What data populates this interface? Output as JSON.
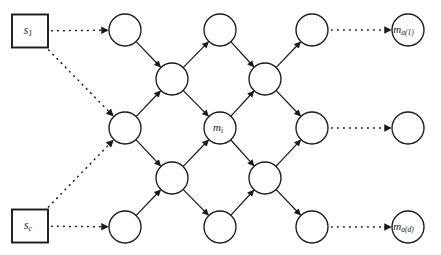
{
  "figure": {
    "background_color": "#ffffff",
    "stroke_color": "#1a1a1a",
    "width": 441,
    "height": 255
  },
  "sources": [
    {
      "id": "s1",
      "label": "s",
      "sub": "1",
      "x": 30,
      "y": 31,
      "w": 36,
      "h": 33
    },
    {
      "id": "sc",
      "label": "s",
      "sub": "c",
      "x": 30,
      "y": 226,
      "w": 36,
      "h": 33
    }
  ],
  "nodes": [
    {
      "id": "n-c1-r1",
      "x": 125,
      "y": 30,
      "r": 16,
      "label": "",
      "sub": ""
    },
    {
      "id": "n-c2-r1",
      "x": 220,
      "y": 30,
      "r": 16,
      "label": "",
      "sub": ""
    },
    {
      "id": "n-c3-r1",
      "x": 312,
      "y": 30,
      "r": 16,
      "label": "",
      "sub": ""
    },
    {
      "id": "n-out-top",
      "x": 408,
      "y": 30,
      "r": 16,
      "label": "m",
      "sub": "a(1)"
    },
    {
      "id": "n-c1-r2",
      "x": 172,
      "y": 79,
      "r": 16,
      "label": "",
      "sub": ""
    },
    {
      "id": "n-c2-r2",
      "x": 265,
      "y": 79,
      "r": 16,
      "label": "",
      "sub": ""
    },
    {
      "id": "n-c0-r3",
      "x": 125,
      "y": 128,
      "r": 16,
      "label": "",
      "sub": ""
    },
    {
      "id": "n-c2-r3",
      "x": 220,
      "y": 128,
      "r": 16,
      "label": "m",
      "sub": "i"
    },
    {
      "id": "n-c3-r3",
      "x": 312,
      "y": 128,
      "r": 16,
      "label": "",
      "sub": ""
    },
    {
      "id": "n-out-mid",
      "x": 408,
      "y": 128,
      "r": 16,
      "label": "",
      "sub": ""
    },
    {
      "id": "n-c1-r4",
      "x": 172,
      "y": 178,
      "r": 16,
      "label": "",
      "sub": ""
    },
    {
      "id": "n-c2-r4",
      "x": 265,
      "y": 178,
      "r": 16,
      "label": "",
      "sub": ""
    },
    {
      "id": "n-c1-r5",
      "x": 125,
      "y": 227,
      "r": 16,
      "label": "",
      "sub": ""
    },
    {
      "id": "n-c2-r5",
      "x": 220,
      "y": 227,
      "r": 16,
      "label": "",
      "sub": ""
    },
    {
      "id": "n-c3-r5",
      "x": 312,
      "y": 227,
      "r": 16,
      "label": "",
      "sub": ""
    },
    {
      "id": "n-out-bot",
      "x": 408,
      "y": 227,
      "r": 16,
      "label": "m",
      "sub": "a(d)"
    }
  ],
  "solid_edges": [
    {
      "from": "n-c1-r1",
      "to": "n-c1-r2"
    },
    {
      "from": "n-c1-r2",
      "to": "n-c2-r1"
    },
    {
      "from": "n-c2-r1",
      "to": "n-c2-r2"
    },
    {
      "from": "n-c2-r2",
      "to": "n-c3-r1"
    },
    {
      "from": "n-c0-r3",
      "to": "n-c1-r2"
    },
    {
      "from": "n-c1-r2",
      "to": "n-c2-r3"
    },
    {
      "from": "n-c2-r3",
      "to": "n-c2-r2"
    },
    {
      "from": "n-c2-r2",
      "to": "n-c3-r3"
    },
    {
      "from": "n-c0-r3",
      "to": "n-c1-r4"
    },
    {
      "from": "n-c1-r4",
      "to": "n-c2-r3"
    },
    {
      "from": "n-c2-r3",
      "to": "n-c2-r4"
    },
    {
      "from": "n-c2-r4",
      "to": "n-c3-r3"
    },
    {
      "from": "n-c1-r5",
      "to": "n-c1-r4"
    },
    {
      "from": "n-c1-r4",
      "to": "n-c2-r5"
    },
    {
      "from": "n-c2-r5",
      "to": "n-c2-r4"
    },
    {
      "from": "n-c2-r4",
      "to": "n-c3-r5"
    }
  ],
  "dotted_edges": [
    {
      "from": "s1",
      "to": "n-c1-r1",
      "kind": "box-to-node"
    },
    {
      "from": "s1",
      "to": "n-c0-r3",
      "kind": "box-to-node"
    },
    {
      "from": "sc",
      "to": "n-c1-r5",
      "kind": "box-to-node"
    },
    {
      "from": "sc",
      "to": "n-c0-r3",
      "kind": "box-to-node"
    },
    {
      "from": "n-c3-r1",
      "to": "n-out-top",
      "kind": "node-to-node"
    },
    {
      "from": "n-c3-r3",
      "to": "n-out-mid",
      "kind": "node-to-node"
    },
    {
      "from": "n-c3-r5",
      "to": "n-out-bot",
      "kind": "node-to-node"
    }
  ]
}
